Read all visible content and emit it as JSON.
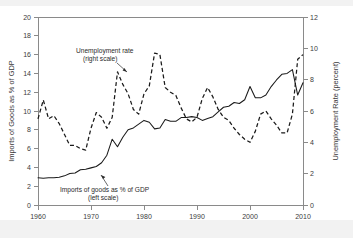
{
  "figure": {
    "background_color": "#ffffff",
    "frame_color": "#8a8a8a",
    "series_color": "#1a1a1a"
  },
  "chart_data": {
    "type": "line",
    "title": "",
    "xlabel": "",
    "grid": false,
    "legend_position": "inline-annotations",
    "xlim": [
      1960,
      2010
    ],
    "xticks": [
      1960,
      1970,
      1980,
      1990,
      2000,
      2010
    ],
    "xtick_labels": [
      "1960",
      "1970",
      "1980",
      "1990",
      "2000",
      "2010"
    ],
    "left_axis": {
      "label": "Imports of Goods as % of GDP",
      "ylim": [
        0,
        20
      ],
      "ticks": [
        0,
        2,
        4,
        6,
        8,
        10,
        12,
        14,
        16,
        18,
        20
      ],
      "tick_labels": [
        "0",
        "2",
        "4",
        "6",
        "8",
        "10",
        "12",
        "14",
        "16",
        "18",
        "20"
      ]
    },
    "right_axis": {
      "label": "Unemployment Rate (percent)",
      "ylim": [
        0,
        12
      ],
      "ticks": [
        0,
        2,
        4,
        6,
        8,
        10,
        12
      ],
      "tick_labels": [
        "0",
        "2",
        "4",
        "6",
        "8",
        "10",
        "12"
      ]
    },
    "annotations": [
      {
        "id": "unemployment-annotation",
        "line1": "Unemployment rate",
        "line2": "(right scale)"
      },
      {
        "id": "imports-annotation",
        "line1": "Imports of goods as % of GDP",
        "line2": "(left scale)"
      }
    ],
    "x": [
      1960,
      1961,
      1962,
      1963,
      1964,
      1965,
      1966,
      1967,
      1968,
      1969,
      1970,
      1971,
      1972,
      1973,
      1974,
      1975,
      1976,
      1977,
      1978,
      1979,
      1980,
      1981,
      1982,
      1983,
      1984,
      1985,
      1986,
      1987,
      1988,
      1989,
      1990,
      1991,
      1992,
      1993,
      1994,
      1995,
      1996,
      1997,
      1998,
      1999,
      2000,
      2001,
      2002,
      2003,
      2004,
      2005,
      2006,
      2007,
      2008,
      2009,
      2010
    ],
    "series": [
      {
        "name": "Imports of goods as % of GDP",
        "style": "solid",
        "axis": "left",
        "unit": "percent of GDP",
        "values": [
          2.9,
          2.85,
          2.9,
          2.9,
          2.95,
          3.1,
          3.35,
          3.4,
          3.75,
          3.8,
          3.95,
          4.1,
          4.5,
          5.3,
          7.0,
          6.2,
          7.2,
          8.0,
          8.2,
          8.6,
          9.0,
          8.8,
          8.1,
          8.2,
          9.1,
          8.9,
          8.9,
          9.3,
          9.3,
          9.4,
          9.3,
          9.0,
          9.2,
          9.4,
          9.9,
          10.4,
          10.5,
          10.9,
          10.8,
          11.2,
          12.6,
          11.4,
          11.4,
          11.7,
          12.6,
          13.3,
          13.9,
          14.0,
          14.4,
          11.7,
          13.0
        ]
      },
      {
        "name": "Unemployment rate",
        "style": "dashed",
        "axis": "right",
        "unit": "percent",
        "values": [
          5.5,
          6.7,
          5.5,
          5.7,
          5.2,
          4.5,
          3.8,
          3.8,
          3.6,
          3.5,
          4.9,
          5.9,
          5.6,
          4.9,
          5.6,
          8.5,
          7.7,
          7.1,
          6.1,
          5.8,
          7.1,
          7.6,
          9.7,
          9.6,
          7.5,
          7.2,
          7.0,
          6.2,
          5.5,
          5.3,
          5.6,
          6.8,
          7.5,
          6.9,
          6.1,
          5.6,
          5.4,
          4.9,
          4.5,
          4.2,
          4.0,
          4.7,
          5.8,
          6.0,
          5.5,
          5.1,
          4.6,
          4.6,
          5.8,
          9.3,
          9.6
        ]
      }
    ]
  }
}
